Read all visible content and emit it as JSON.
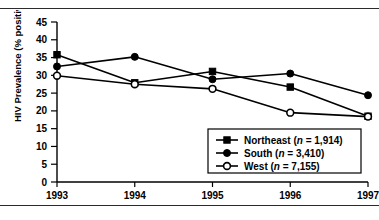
{
  "figure": {
    "name": "hiv-prevalence-by-region-line-chart",
    "top_rule": true,
    "bottom_rule": true
  },
  "chart_data": {
    "type": "line",
    "title": "",
    "xlabel": "",
    "ylabel": "HIV Prevalence (% positive)",
    "categories": [
      "1993",
      "1994",
      "1995",
      "1996",
      "1997"
    ],
    "x": [
      1993,
      1994,
      1995,
      1996,
      1997
    ],
    "xlim": [
      1993,
      1997
    ],
    "ylim": [
      0,
      45
    ],
    "yticks": [
      0,
      5,
      10,
      15,
      20,
      25,
      30,
      35,
      40,
      45
    ],
    "ytick_labels": [
      "0",
      "5",
      "10",
      "15",
      "20",
      "25",
      "30",
      "35",
      "40",
      "45"
    ],
    "xtick_labels": [
      "1993",
      "1994",
      "1995",
      "1996",
      "1997"
    ],
    "grid": false,
    "legend_position": "lower right",
    "series": [
      {
        "name": "Northeast",
        "label": "Northeast (n = 1,914)",
        "label_prefix": "Northeast (",
        "label_italic": "n",
        "label_suffix": " = 1,914)",
        "n": "1,914",
        "marker": "filled-square",
        "color": "#000000",
        "values": [
          35.8,
          27.9,
          31.1,
          26.7,
          18.5
        ]
      },
      {
        "name": "South",
        "label": "South (n = 3,410)",
        "label_prefix": "South (",
        "label_italic": "n",
        "label_suffix": " = 3,410)",
        "n": "3,410",
        "marker": "filled-circle",
        "color": "#000000",
        "values": [
          32.5,
          35.2,
          28.9,
          30.5,
          24.4
        ]
      },
      {
        "name": "West",
        "label": "West (n = 7,155)",
        "label_prefix": "West (",
        "label_italic": "n",
        "label_suffix": " = 7,155)",
        "n": "7,155",
        "marker": "open-circle",
        "color": "#000000",
        "values": [
          29.9,
          27.5,
          26.2,
          19.5,
          18.4
        ]
      }
    ]
  }
}
